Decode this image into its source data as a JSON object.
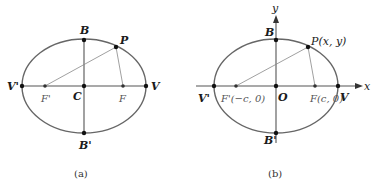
{
  "colors": {
    "ellipse": "#666666",
    "axis": "#555555",
    "line": "#777777",
    "point": "#111111",
    "text": "#1a1a1a"
  },
  "panel_a": {
    "caption": "(a)",
    "labels": {
      "B": "B",
      "P": "P",
      "V_prime": "V'",
      "V": "V",
      "F_prime": "F'",
      "C": "C",
      "F": "F",
      "B_prime": "B'"
    }
  },
  "panel_b": {
    "caption": "(b)",
    "labels": {
      "y_axis": "y",
      "x_axis": "x",
      "B": "B",
      "P": "P(x, y)",
      "V_prime": "V'",
      "F_prime": "F'(−c, 0)",
      "O": "O",
      "F": "F(c, 0)",
      "V": "V",
      "B_prime": "B'"
    }
  }
}
